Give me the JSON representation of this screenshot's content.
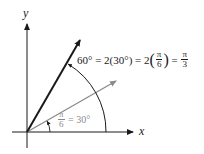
{
  "diagram": {
    "axes": {
      "x_label": "x",
      "y_label": "y"
    },
    "rays": [
      {
        "name": "ray-60",
        "angle_deg": 60,
        "color": "#1a1a1a"
      },
      {
        "name": "ray-30",
        "angle_deg": 30,
        "color": "#8a8a8a"
      }
    ],
    "label_60": {
      "lhs": "60° = 2(30°) = 2",
      "frac1_num": "π",
      "frac1_den": "6",
      "mid": " = ",
      "frac2_num": "π",
      "frac2_den": "3"
    },
    "label_30": {
      "frac_num": "π",
      "frac_den": "6",
      "rhs": " = 30°"
    },
    "colors": {
      "dark": "#1a1a1a",
      "gray": "#8a8a8a"
    }
  }
}
